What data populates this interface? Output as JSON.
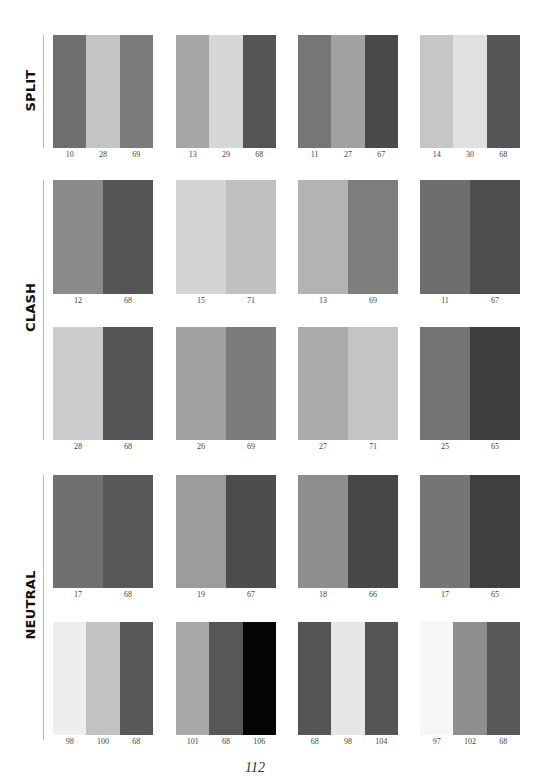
{
  "sections": [
    {
      "name": "SPLIT"
    },
    {
      "name": "CLASH"
    },
    {
      "name": "NEUTRAL"
    }
  ],
  "swatches": [
    {
      "section": "SPLIT",
      "row": 0,
      "col": 0,
      "codes": [
        "10",
        "28",
        "69"
      ],
      "colors": [
        "#6f6f6f",
        "#c4c4c4",
        "#7b7b7b"
      ]
    },
    {
      "section": "SPLIT",
      "row": 0,
      "col": 1,
      "codes": [
        "13",
        "29",
        "68"
      ],
      "colors": [
        "#a6a6a6",
        "#d6d6d6",
        "#555555"
      ]
    },
    {
      "section": "SPLIT",
      "row": 0,
      "col": 2,
      "codes": [
        "11",
        "27",
        "67"
      ],
      "colors": [
        "#767676",
        "#a2a2a2",
        "#4a4a4a"
      ]
    },
    {
      "section": "SPLIT",
      "row": 0,
      "col": 3,
      "codes": [
        "14",
        "30",
        "68"
      ],
      "colors": [
        "#c6c6c6",
        "#e0e0e0",
        "#555555"
      ]
    },
    {
      "section": "CLASH",
      "row": 1,
      "col": 0,
      "codes": [
        "12",
        "68"
      ],
      "colors": [
        "#8a8a8a",
        "#555555"
      ]
    },
    {
      "section": "CLASH",
      "row": 1,
      "col": 1,
      "codes": [
        "15",
        "71"
      ],
      "colors": [
        "#d4d4d4",
        "#c0c0c0"
      ]
    },
    {
      "section": "CLASH",
      "row": 1,
      "col": 2,
      "codes": [
        "13",
        "69"
      ],
      "colors": [
        "#b3b3b3",
        "#7e7e7e"
      ]
    },
    {
      "section": "CLASH",
      "row": 1,
      "col": 3,
      "codes": [
        "11",
        "67"
      ],
      "colors": [
        "#6e6e6e",
        "#4e4e4e"
      ]
    },
    {
      "section": "CLASH",
      "row": 2,
      "col": 0,
      "codes": [
        "28",
        "68"
      ],
      "colors": [
        "#cbcbcb",
        "#555555"
      ]
    },
    {
      "section": "CLASH",
      "row": 2,
      "col": 1,
      "codes": [
        "26",
        "69"
      ],
      "colors": [
        "#a2a2a2",
        "#7c7c7c"
      ]
    },
    {
      "section": "CLASH",
      "row": 2,
      "col": 2,
      "codes": [
        "27",
        "71"
      ],
      "colors": [
        "#ababab",
        "#c4c4c4"
      ]
    },
    {
      "section": "CLASH",
      "row": 2,
      "col": 3,
      "codes": [
        "25",
        "65"
      ],
      "colors": [
        "#737373",
        "#3d3d3d"
      ]
    },
    {
      "section": "NEUTRAL",
      "row": 3,
      "col": 0,
      "codes": [
        "17",
        "68"
      ],
      "colors": [
        "#707070",
        "#585858"
      ]
    },
    {
      "section": "NEUTRAL",
      "row": 3,
      "col": 1,
      "codes": [
        "19",
        "67"
      ],
      "colors": [
        "#9c9c9c",
        "#4d4d4d"
      ]
    },
    {
      "section": "NEUTRAL",
      "row": 3,
      "col": 2,
      "codes": [
        "18",
        "66"
      ],
      "colors": [
        "#8e8e8e",
        "#474747"
      ]
    },
    {
      "section": "NEUTRAL",
      "row": 3,
      "col": 3,
      "codes": [
        "17",
        "65"
      ],
      "colors": [
        "#757575",
        "#3f3f3f"
      ]
    },
    {
      "section": "NEUTRAL",
      "row": 4,
      "col": 0,
      "codes": [
        "98",
        "100",
        "68"
      ],
      "colors": [
        "#eeeeee",
        "#c2c2c2",
        "#585858"
      ]
    },
    {
      "section": "NEUTRAL",
      "row": 4,
      "col": 1,
      "codes": [
        "101",
        "68",
        "106"
      ],
      "colors": [
        "#a8a8a8",
        "#575757",
        "#050505"
      ]
    },
    {
      "section": "NEUTRAL",
      "row": 4,
      "col": 2,
      "codes": [
        "68",
        "98",
        "104"
      ],
      "colors": [
        "#555555",
        "#e6e6e6",
        "#555555"
      ]
    },
    {
      "section": "NEUTRAL",
      "row": 4,
      "col": 3,
      "codes": [
        "97",
        "102",
        "68"
      ],
      "colors": [
        "#f6f6f6",
        "#8f8f8f",
        "#585858"
      ]
    }
  ],
  "page_number": "112"
}
